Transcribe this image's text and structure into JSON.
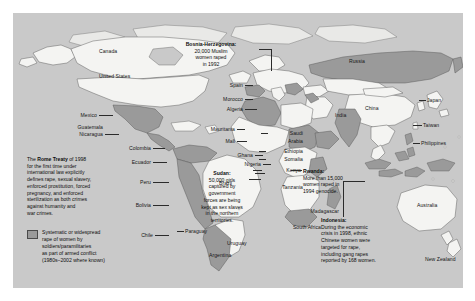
{
  "figure": {
    "type": "world-map",
    "theme": "Systematic or widespread rape of women in armed conflict",
    "colors": {
      "ocean": "#c9c9c9",
      "land_unshaded": "#f4f4f2",
      "land_shaded": "#9a9a9a",
      "border": "#4a4a4a",
      "text": "#0d0d0d",
      "page_background": "#ffffff"
    }
  },
  "legend": {
    "swatch_color": "#9a9a9a",
    "lines": [
      "Systematic or widespread",
      "rape of women by",
      "soldiers/paramilitaries",
      "as part of armed conflict",
      "(1980s–2002 where known)"
    ]
  },
  "callouts": [
    {
      "id": "rome-treaty",
      "title": "The Rome Treaty",
      "lines": [
        "The Rome Treaty of 1998",
        "for the first time under",
        "international law explicitly",
        "defines rape, sexual slavery,",
        "enforced prostitution, forced",
        "pregnancy, and enforced",
        "sterilization as both crimes",
        "against humanity and",
        "war crimes."
      ]
    },
    {
      "id": "bosnia",
      "title": "Bosnia-Herzegovina:",
      "lines": [
        "20,000 Muslim",
        "women raped",
        "in 1992"
      ]
    },
    {
      "id": "sudan",
      "title": "Sudan:",
      "lines": [
        "50,000 girls",
        "captured by",
        "government",
        "forces are being",
        "kept as sex slaves",
        "in the northern",
        "territories."
      ]
    },
    {
      "id": "rwanda",
      "title": "Rwanda:",
      "lines": [
        "More than 15,000",
        "women raped in",
        "1994 genocide."
      ]
    },
    {
      "id": "indonesia",
      "title": "Indonesia:",
      "lines": [
        "During the economic",
        "crisis in 1998, ethnic",
        "Chinese women were",
        "targeted for rape,",
        "including gang rapes",
        "reported by 168 women."
      ]
    }
  ],
  "country_labels": [
    {
      "name": "Canada",
      "text": "Canada"
    },
    {
      "name": "United States",
      "text": "United States"
    },
    {
      "name": "Mexico",
      "text": "Mexico"
    },
    {
      "name": "Guatemala",
      "text": "Guatemala"
    },
    {
      "name": "Nicaragua",
      "text": "Nicaragua"
    },
    {
      "name": "Colombia",
      "text": "Colombia"
    },
    {
      "name": "Ecuador",
      "text": "Ecuador"
    },
    {
      "name": "Peru",
      "text": "Peru"
    },
    {
      "name": "Brazil",
      "text": "Brazil"
    },
    {
      "name": "Bolivia",
      "text": "Bolivia"
    },
    {
      "name": "Chile",
      "text": "Chile"
    },
    {
      "name": "Paraguay",
      "text": "Paraguay"
    },
    {
      "name": "Uruguay",
      "text": "Uruguay"
    },
    {
      "name": "Argentina",
      "text": "Argentina"
    },
    {
      "name": "Spain",
      "text": "Spain"
    },
    {
      "name": "Morocco",
      "text": "Morocco"
    },
    {
      "name": "Algeria",
      "text": "Algeria"
    },
    {
      "name": "Mauritania",
      "text": "Mauritania"
    },
    {
      "name": "Mali",
      "text": "Mali"
    },
    {
      "name": "Ghana",
      "text": "Ghana"
    },
    {
      "name": "Nigeria",
      "text": "Nigeria"
    },
    {
      "name": "Russia",
      "text": "Russia"
    },
    {
      "name": "China",
      "text": "China"
    },
    {
      "name": "Japan",
      "text": "Japan"
    },
    {
      "name": "Taiwan",
      "text": "Taiwan"
    },
    {
      "name": "India",
      "text": "India"
    },
    {
      "name": "Philippines",
      "text": "Philippines"
    },
    {
      "name": "Saudi Arabia",
      "text": "Saudi"
    },
    {
      "name": "Saudi Arabia 2",
      "text": "Arabia"
    },
    {
      "name": "Ethiopia",
      "text": "Ethiopia"
    },
    {
      "name": "Somalia",
      "text": "Somalia"
    },
    {
      "name": "Kenya",
      "text": "Kenya"
    },
    {
      "name": "Tanzania",
      "text": "Tanzania"
    },
    {
      "name": "Madagascar",
      "text": "Madagascar"
    },
    {
      "name": "South Africa",
      "text": "South Africa"
    },
    {
      "name": "Australia",
      "text": "Australia"
    },
    {
      "name": "New Zealand",
      "text": "New Zealand"
    }
  ],
  "labels": {
    "canada": "Canada",
    "united_states": "United States",
    "mexico": "Mexico",
    "guatemala": "Guatemala",
    "nicaragua": "Nicaragua",
    "colombia": "Colombia",
    "ecuador": "Ecuador",
    "peru": "Peru",
    "brazil": "Brazil",
    "bolivia": "Bolivia",
    "chile": "Chile",
    "paraguay": "Paraguay",
    "uruguay": "Uruguay",
    "argentina": "Argentina",
    "spain": "Spain",
    "morocco": "Morocco",
    "algeria": "Algeria",
    "mauritania": "Mauritania",
    "mali": "Mali",
    "ghana": "Ghana",
    "nigeria": "Nigeria",
    "russia": "Russia",
    "china": "China",
    "japan": "Japan",
    "taiwan": "Taiwan",
    "india": "India",
    "philippines": "Philippines",
    "saudi_1": "Saudi",
    "saudi_2": "Arabia",
    "ethiopia": "Ethiopia",
    "somalia": "Somalia",
    "kenya": "Kenya",
    "tanzania": "Tanzania",
    "madagascar": "Madagascar",
    "south_africa": "South Africa",
    "australia": "Australia",
    "new_zealand": "New Zealand"
  },
  "rome_treaty": {
    "l1_a": "The ",
    "l1_b": "Rome Treaty",
    "l1_c": " of 1998",
    "l2": "for the first time under",
    "l3": "international law explicitly",
    "l4": "defines rape, sexual slavery,",
    "l5": "enforced prostitution, forced",
    "l6": "pregnancy, and enforced",
    "l7": "sterilization as both crimes",
    "l8": "against humanity and",
    "l9": "war crimes."
  },
  "bosnia": {
    "title": "Bosnia-Herzegovina:",
    "l1": "20,000 Muslim",
    "l2": "women raped",
    "l3": "in 1992"
  },
  "sudan": {
    "title": "Sudan:",
    "l1": "50,000 girls",
    "l2": "captured by",
    "l3": "government",
    "l4": "forces are being",
    "l5": "kept as sex slaves",
    "l6": "in the northern",
    "l7": "territories."
  },
  "rwanda": {
    "title": "Rwanda:",
    "l1": "More than 15,000",
    "l2": "women raped in",
    "l3": "1994 genocide."
  },
  "indonesia": {
    "title": "Indonesia:",
    "l1": "During the economic",
    "l2": "crisis in 1998, ethnic",
    "l3": "Chinese women were",
    "l4": "targeted for rape,",
    "l5": "including gang rapes",
    "l6": "reported by 168 women."
  },
  "legend_text": {
    "l1": "Systematic or widespread",
    "l2": "rape of women by",
    "l3": "soldiers/paramilitaries",
    "l4": "as part of armed conflict",
    "l5": "(1980s–2002 where known)"
  }
}
